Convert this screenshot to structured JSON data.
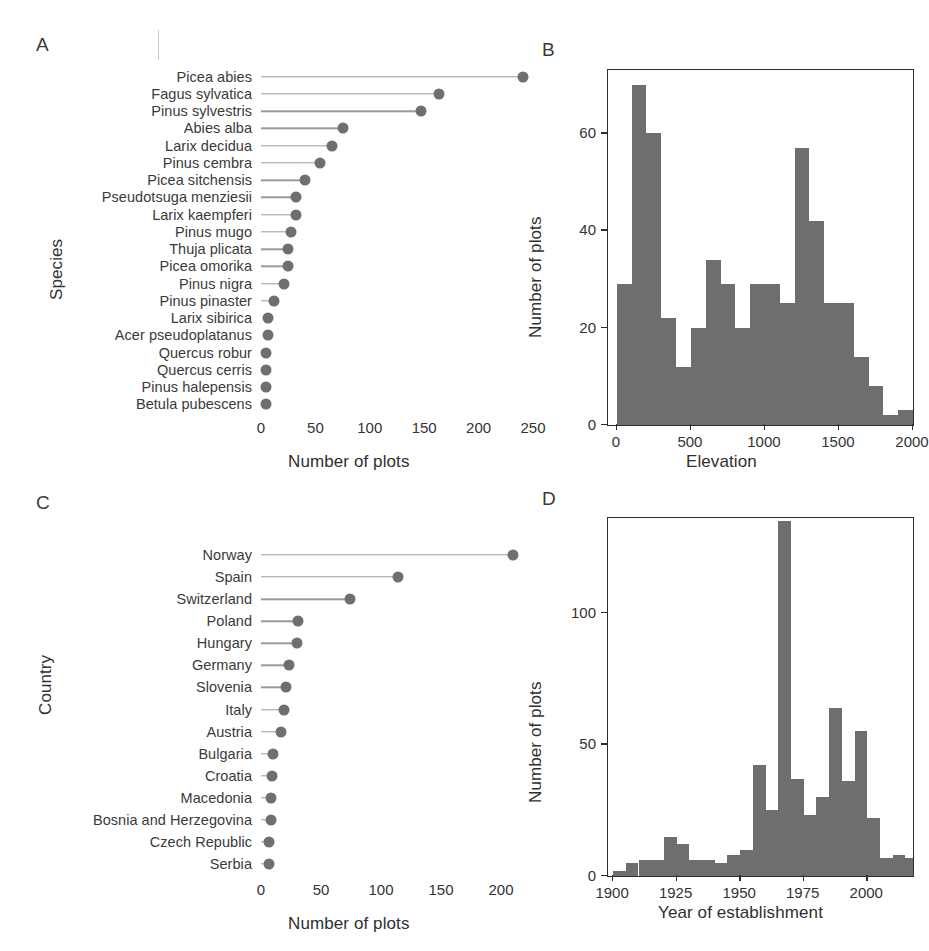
{
  "figure": {
    "panels": [
      "A",
      "B",
      "C",
      "D"
    ]
  },
  "chart_data": [
    {
      "panel": "A",
      "type": "bar",
      "subtype": "lollipop-horizontal",
      "title": "",
      "xlabel": "Number of plots",
      "ylabel": "Species",
      "xlim": [
        0,
        250
      ],
      "xticks": [
        0,
        50,
        100,
        150,
        200,
        250
      ],
      "xtick_labels": [
        "0",
        "50",
        "100",
        "150",
        "200",
        "250"
      ],
      "grid": false,
      "legend": "none",
      "categories": [
        "Picea abies",
        "Fagus sylvatica",
        "Pinus sylvestris",
        "Abies alba",
        "Larix decidua",
        "Pinus cembra",
        "Picea sitchensis",
        "Pseudotsuga menziesii",
        "Larix kaempferi",
        "Pinus mugo",
        "Thuja plicata",
        "Picea omorika",
        "Pinus nigra",
        "Pinus pinaster",
        "Larix sibirica",
        "Acer pseudoplatanus",
        "Quercus robur",
        "Quercus cerris",
        "Pinus halepensis",
        "Betula pubescens"
      ],
      "values": [
        241,
        164,
        147,
        75,
        65,
        54,
        40,
        32,
        32,
        28,
        25,
        25,
        21,
        12,
        6,
        6,
        5,
        5,
        5,
        5
      ]
    },
    {
      "panel": "B",
      "type": "bar",
      "subtype": "histogram",
      "title": "",
      "xlabel": "Elevation",
      "ylabel": "Number of plots",
      "xlim": [
        -60,
        2000
      ],
      "ylim": [
        0,
        73
      ],
      "xticks": [
        0,
        500,
        1000,
        1500,
        2000
      ],
      "xtick_labels": [
        "0",
        "500",
        "1000",
        "1500",
        "2000"
      ],
      "yticks": [
        0,
        20,
        40,
        60
      ],
      "ytick_labels": [
        "0",
        "20",
        "40",
        "60"
      ],
      "grid": false,
      "legend": "none",
      "bin_width": 100,
      "bin_starts": [
        0,
        100,
        200,
        300,
        400,
        500,
        600,
        700,
        800,
        900,
        1000,
        1100,
        1200,
        1300,
        1400,
        1500,
        1600,
        1700,
        1800,
        1900
      ],
      "values": [
        29,
        70,
        60,
        22,
        12,
        20,
        34,
        29,
        20,
        29,
        29,
        25,
        57,
        42,
        25,
        25,
        14,
        8,
        2,
        3
      ]
    },
    {
      "panel": "C",
      "type": "bar",
      "subtype": "lollipop-horizontal",
      "title": "",
      "xlabel": "Number of plots",
      "ylabel": "Country",
      "xlim": [
        0,
        200
      ],
      "xticks": [
        0,
        50,
        100,
        150,
        200
      ],
      "xtick_labels": [
        "0",
        "50",
        "100",
        "150",
        "200"
      ],
      "grid": false,
      "legend": "none",
      "categories": [
        "Norway",
        "Spain",
        "Switzerland",
        "Poland",
        "Hungary",
        "Germany",
        "Slovenia",
        "Italy",
        "Austria",
        "Bulgaria",
        "Croatia",
        "Macedonia",
        "Bosnia and Herzegovina",
        "Czech Republic",
        "Serbia"
      ],
      "values": [
        210,
        114,
        74,
        31,
        30,
        23,
        21,
        19,
        17,
        10,
        9,
        8,
        8,
        7,
        7
      ]
    },
    {
      "panel": "D",
      "type": "bar",
      "subtype": "histogram",
      "title": "",
      "xlabel": "Year of establishment",
      "ylabel": "Number of plots",
      "xlim": [
        1898,
        2018
      ],
      "ylim": [
        0,
        136
      ],
      "xticks": [
        1900,
        1925,
        1950,
        1975,
        2000
      ],
      "xtick_labels": [
        "1900",
        "1925",
        "1950",
        "1975",
        "2000"
      ],
      "yticks": [
        0,
        50,
        100
      ],
      "ytick_labels": [
        "0",
        "50",
        "100"
      ],
      "grid": false,
      "legend": "none",
      "bin_width": 5,
      "bin_starts": [
        1900,
        1905,
        1910,
        1915,
        1920,
        1925,
        1930,
        1935,
        1940,
        1945,
        1950,
        1955,
        1960,
        1965,
        1970,
        1975,
        1980,
        1985,
        1990,
        1995,
        2000,
        2005,
        2010,
        2015
      ],
      "values": [
        2,
        5,
        6,
        6,
        15,
        12,
        6,
        6,
        5,
        8,
        10,
        42,
        25,
        135,
        37,
        23,
        30,
        64,
        36,
        55,
        22,
        7,
        8,
        7
      ]
    }
  ]
}
